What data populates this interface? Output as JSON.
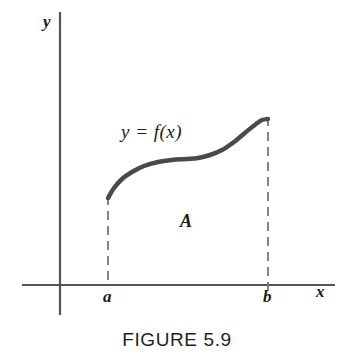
{
  "figure": {
    "caption": "FIGURE 5.9",
    "background_color": "#ffffff"
  },
  "axes": {
    "y_label": "y",
    "x_label": "x",
    "axis_color": "#555555",
    "origin": {
      "x": 60,
      "y": 285
    },
    "x_axis": {
      "start_x": 22,
      "end_x": 335,
      "y": 285
    },
    "y_axis": {
      "x": 60,
      "top_y": 12,
      "bottom_y": 315
    }
  },
  "ticks": [
    {
      "label": "a",
      "x": 108
    },
    {
      "label": "b",
      "x": 268
    }
  ],
  "annotations": {
    "curve_equation": "y = f(x)",
    "region": "A"
  },
  "chart_data": {
    "type": "line",
    "title": "FIGURE 5.9",
    "xlabel": "x",
    "ylabel": "y",
    "curve_label": "y = f(x)",
    "region_label": "A",
    "curve_color": "#4a4a4a",
    "curve_width": 4.5,
    "dashed_color": "#777777",
    "x_bounds": {
      "a": 108,
      "b": 268
    },
    "baseline_y": 285,
    "points": [
      {
        "x": 108,
        "y": 198
      },
      {
        "x": 114,
        "y": 188
      },
      {
        "x": 122,
        "y": 179
      },
      {
        "x": 132,
        "y": 172
      },
      {
        "x": 144,
        "y": 166
      },
      {
        "x": 158,
        "y": 162
      },
      {
        "x": 172,
        "y": 160
      },
      {
        "x": 186,
        "y": 159
      },
      {
        "x": 198,
        "y": 158
      },
      {
        "x": 210,
        "y": 155
      },
      {
        "x": 222,
        "y": 150
      },
      {
        "x": 234,
        "y": 142
      },
      {
        "x": 246,
        "y": 132
      },
      {
        "x": 256,
        "y": 124
      },
      {
        "x": 262,
        "y": 120
      },
      {
        "x": 268,
        "y": 119
      }
    ],
    "dashed_lines": [
      {
        "name": "left-boundary",
        "x": 108,
        "y_top": 198,
        "y_bottom": 285
      },
      {
        "name": "right-boundary",
        "x": 268,
        "y_top": 119,
        "y_bottom": 290
      }
    ],
    "grid": false,
    "legend": "none"
  }
}
